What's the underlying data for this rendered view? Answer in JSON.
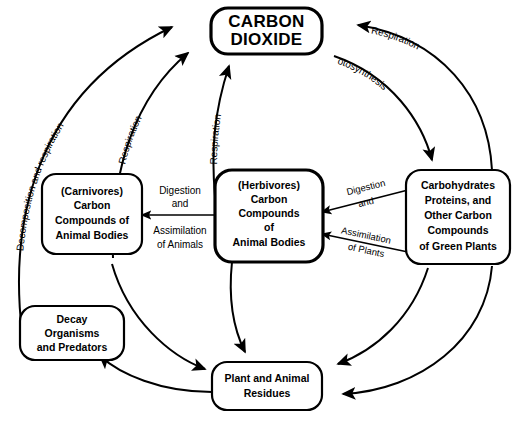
{
  "diagram": {
    "background_color": "#ffffff",
    "line_color": "#000000",
    "nodes": {
      "carbon_dioxide": {
        "id": "carbon-dioxide",
        "lines": [
          "CARBON",
          "DIOXIDE"
        ]
      },
      "carnivores": {
        "id": "carnivores",
        "lines": [
          "(Carnivores)",
          "Carbon",
          "Compounds of",
          "Animal Bodies"
        ]
      },
      "herbivores": {
        "id": "herbivores",
        "lines": [
          "(Herbivores)",
          "Carbon",
          "Compounds",
          "of",
          "Animal  Bodies"
        ]
      },
      "green_plants": {
        "id": "green-plants",
        "lines": [
          "Carbohydrates",
          "Proteins, and",
          "Other  Carbon",
          "Compounds",
          "of  Green  Plants"
        ]
      },
      "decay_organisms": {
        "id": "decay-organisms",
        "lines": [
          "Decay",
          "Organisms",
          "and  Predators"
        ]
      },
      "residues": {
        "id": "residues",
        "lines": [
          "Plant  and  Animal",
          "Residues"
        ]
      }
    },
    "edge_labels": {
      "decomposition_respiration": "Decomposition and respiration",
      "respiration_carnivores": "Respiration",
      "respiration_herbivores": "Respiration",
      "photosynthesis": "Photosynthesis",
      "respiration_plants": "Respiration",
      "digestion_animals_line1": "Digestion",
      "digestion_animals_line2": "and",
      "assimilation_animals_line1": "Assimilation",
      "assimilation_animals_line2": "of  Animals",
      "digestion_plants_line1": "Digestion",
      "digestion_plants_line2": "and",
      "assimilation_plants_line1": "Assimilation",
      "assimilation_plants_line2": "of  Plants"
    }
  }
}
